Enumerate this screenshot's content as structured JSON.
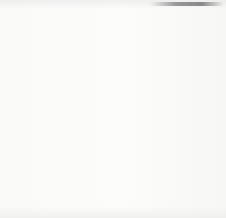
{
  "diagram": {
    "type": "flow-diagram",
    "background_color": "#fbfbfa",
    "stroke_color": "#1d1d1d",
    "text_color": "#1d1d1d",
    "nodes": [
      {
        "id": "father",
        "name": "Father",
        "status": "Rh +",
        "shape": "circle",
        "cx": 42,
        "cy": 44,
        "r": 28
      },
      {
        "id": "mother",
        "name": "Mother",
        "status": "Rh —",
        "shape": "circle",
        "cx": 186,
        "cy": 43,
        "r": 29
      },
      {
        "id": "fetus",
        "name": "Fetus",
        "status": "Rh+",
        "shape": "circle",
        "cx": 116,
        "cy": 181,
        "r": 29
      }
    ],
    "edges": [
      {
        "id": "father-to-fetus",
        "from": "father",
        "to": "fetus",
        "label": "",
        "arrowheads": 1
      },
      {
        "id": "fetus-to-mother",
        "from": "fetus",
        "to": "mother",
        "label_line1": "R.B.C.",
        "label_line2": "(Antigen)",
        "arrowheads": 2
      },
      {
        "id": "mother-to-fetus",
        "from": "mother",
        "to": "fetus",
        "label_title": "Antibodies",
        "label_paren_line1": "Agglutinins",
        "label_paren_line2": "Hemolysins",
        "arrowheads": 2
      }
    ]
  }
}
